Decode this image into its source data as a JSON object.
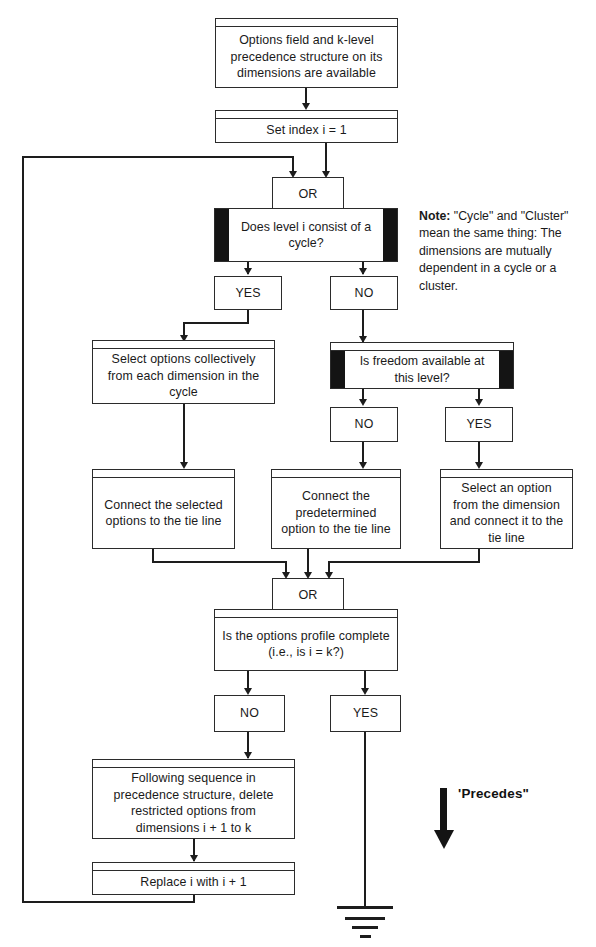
{
  "diagram": {
    "nodes": {
      "start": "Options field and k-level precedence structure on its dimensions are available",
      "set_index": "Set  index  i = 1",
      "or_top": "OR",
      "decision_cycle": "Does level i consist of a cycle?",
      "cycle_yes": "YES",
      "cycle_no": "NO",
      "select_collectively": "Select options collectively from each dimension in the cycle",
      "decision_freedom": "Is freedom available at this level?",
      "freedom_no": "NO",
      "freedom_yes": "YES",
      "connect_selected": "Connect the selected options to the tie line",
      "connect_predetermined": "Connect the predetermined option to the tie line",
      "select_and_connect": "Select an option from the dimension and connect it to the tie line",
      "or_bottom": "OR",
      "decision_complete": "Is the options profile complete (i.e., is i = k?)",
      "complete_no": "NO",
      "complete_yes": "YES",
      "delete_restricted": "Following sequence in precedence structure, delete restricted options from dimensions i + 1 to k",
      "replace_i": "Replace i with i + 1"
    },
    "note": {
      "label": "Note:",
      "text": "\"Cycle\" and \"Cluster\" mean the same thing:  The dimensions are mutually dependent in a cycle or a cluster."
    },
    "legend": {
      "arrow_icon": "thick-down-arrow-icon",
      "label": "'Precedes\""
    },
    "terminator": {
      "icon": "ground-symbol-icon"
    },
    "colors": {
      "line": "#1d1d1d",
      "box_border": "#2b2b2b",
      "cap_fill": "#141414",
      "background": "#ffffff",
      "text": "#1a1a1a"
    }
  }
}
